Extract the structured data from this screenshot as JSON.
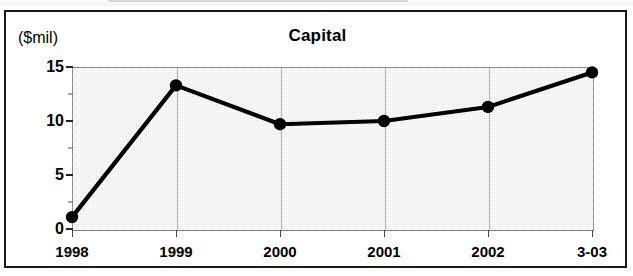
{
  "figure": {
    "title": "Capital",
    "y_axis_unit": "($mil)"
  },
  "chart_data": {
    "type": "line",
    "title": "Capital",
    "xlabel": "",
    "ylabel": "($mil)",
    "categories": [
      "1998",
      "1999",
      "2000",
      "2001",
      "2002",
      "3-03"
    ],
    "values": [
      1.1,
      13.3,
      9.7,
      10.0,
      11.3,
      14.5
    ],
    "series": [
      {
        "name": "Capital",
        "values": [
          1.1,
          13.3,
          9.7,
          10.0,
          11.3,
          14.5
        ]
      }
    ],
    "ylim": [
      0,
      15
    ],
    "y_ticks": [
      0,
      5,
      10,
      15
    ],
    "y_tick_labels": [
      "0",
      "5",
      "10",
      "15"
    ],
    "y_minor_ticks": [
      2.5,
      7.5,
      12.5
    ],
    "grid": false,
    "legend": "none",
    "line_color": "#000000",
    "marker": "circle",
    "marker_color": "#000000",
    "plot_background": "#e6e6e6",
    "frame_color": "#1b1b1b"
  }
}
